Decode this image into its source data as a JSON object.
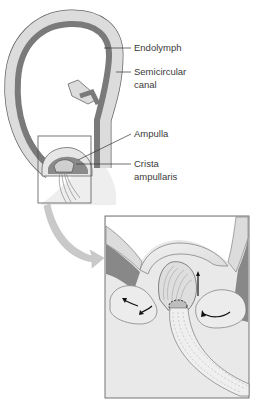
{
  "figure": {
    "labels": {
      "endolymph": "Endolymph",
      "semicircular_canal_line1": "Semicircular",
      "semicircular_canal_line2": "canal",
      "ampulla": "Ampulla",
      "crista_line1": "Crista",
      "crista_line2": "ampullaris"
    },
    "colors": {
      "endolymph_dark": "#7a7a7a",
      "canal_wall_light": "#d6d6d6",
      "outline": "#555555",
      "background": "#ffffff",
      "inset_fill": "#e8e8e8",
      "arrow_fill": "#c9c9c9"
    }
  }
}
